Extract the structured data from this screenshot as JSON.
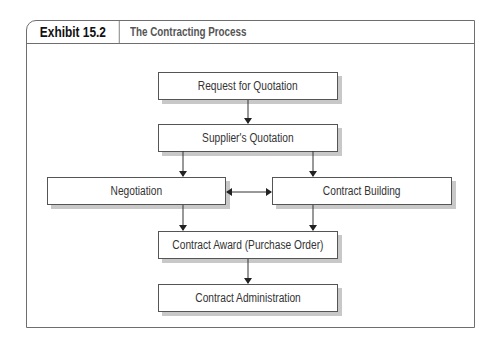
{
  "exhibit": {
    "label": "Exhibit 15.2",
    "title": "The Contracting Process"
  },
  "nodes": [
    {
      "id": "rfq",
      "label": "Request for Quotation"
    },
    {
      "id": "quotation",
      "label": "Supplier's Quotation"
    },
    {
      "id": "negotiation",
      "label": "Negotiation"
    },
    {
      "id": "building",
      "label": "Contract Building"
    },
    {
      "id": "award",
      "label": "Contract Award (Purchase Order)"
    },
    {
      "id": "administration",
      "label": "Contract Administration"
    }
  ],
  "edges": [
    {
      "from": "rfq",
      "to": "quotation"
    },
    {
      "from": "quotation",
      "to": "negotiation"
    },
    {
      "from": "quotation",
      "to": "building"
    },
    {
      "from": "negotiation",
      "to": "building",
      "bidirectional": true
    },
    {
      "from": "negotiation",
      "to": "award"
    },
    {
      "from": "building",
      "to": "award"
    },
    {
      "from": "award",
      "to": "administration"
    }
  ]
}
